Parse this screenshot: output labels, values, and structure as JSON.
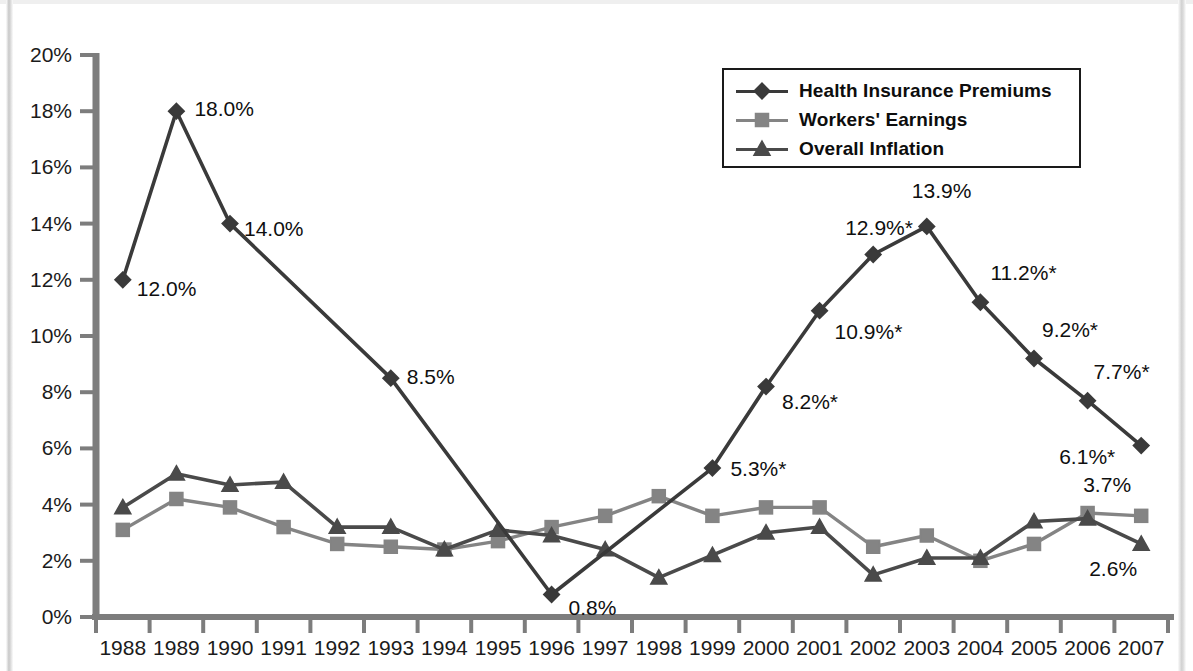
{
  "chart_data": {
    "type": "line",
    "title": "",
    "xlabel": "",
    "ylabel": "",
    "x": [
      1988,
      1989,
      1990,
      1991,
      1992,
      1993,
      1994,
      1995,
      1996,
      1997,
      1998,
      1999,
      2000,
      2001,
      2002,
      2003,
      2004,
      2005,
      2006,
      2007
    ],
    "categories": [
      "1988",
      "1989",
      "1990",
      "1991",
      "1992",
      "1993",
      "1994",
      "1995",
      "1996",
      "1997",
      "1998",
      "1999",
      "2000",
      "2001",
      "2002",
      "2003",
      "2004",
      "2005",
      "2006",
      "2007"
    ],
    "ylim": [
      0,
      20
    ],
    "ytick_values": [
      0,
      2,
      4,
      6,
      8,
      10,
      12,
      14,
      16,
      18,
      20
    ],
    "ytick_labels": [
      "0%",
      "2%",
      "4%",
      "6%",
      "8%",
      "10%",
      "12%",
      "14%",
      "16%",
      "18%",
      "20%"
    ],
    "grid": false,
    "legend_position": "top-right",
    "series": [
      {
        "name": "Health Insurance Premiums",
        "marker": "diamond",
        "color": "#3a3a3a",
        "values": [
          12.0,
          18.0,
          14.0,
          null,
          null,
          8.5,
          null,
          null,
          0.8,
          null,
          null,
          5.3,
          8.2,
          10.9,
          12.9,
          13.9,
          11.2,
          9.2,
          7.7,
          6.1
        ]
      },
      {
        "name": "Workers' Earnings",
        "marker": "square",
        "color": "#848484",
        "values": [
          3.1,
          4.2,
          3.9,
          3.2,
          2.6,
          2.5,
          2.4,
          2.7,
          3.2,
          3.6,
          4.3,
          3.6,
          3.9,
          3.9,
          2.5,
          2.9,
          2.0,
          2.6,
          3.7,
          3.6
        ]
      },
      {
        "name": "Overall Inflation",
        "marker": "triangle",
        "color": "#4a4a4a",
        "values": [
          3.9,
          5.1,
          4.7,
          4.8,
          3.2,
          3.2,
          2.4,
          3.1,
          2.9,
          2.4,
          1.4,
          2.2,
          3.0,
          3.2,
          1.5,
          2.1,
          2.1,
          3.4,
          3.5,
          2.6
        ]
      }
    ],
    "annotations": [
      {
        "series": "Health Insurance Premiums",
        "x": 1988,
        "text": "12.0%"
      },
      {
        "series": "Health Insurance Premiums",
        "x": 1989,
        "text": "18.0%"
      },
      {
        "series": "Health Insurance Premiums",
        "x": 1990,
        "text": "14.0%"
      },
      {
        "series": "Health Insurance Premiums",
        "x": 1993,
        "text": "8.5%"
      },
      {
        "series": "Health Insurance Premiums",
        "x": 1996,
        "text": "0.8%"
      },
      {
        "series": "Health Insurance Premiums",
        "x": 1999,
        "text": "5.3%*"
      },
      {
        "series": "Health Insurance Premiums",
        "x": 2000,
        "text": "8.2%*"
      },
      {
        "series": "Health Insurance Premiums",
        "x": 2001,
        "text": "10.9%*"
      },
      {
        "series": "Health Insurance Premiums",
        "x": 2002,
        "text": "12.9%*"
      },
      {
        "series": "Health Insurance Premiums",
        "x": 2003,
        "text": "13.9%"
      },
      {
        "series": "Health Insurance Premiums",
        "x": 2004,
        "text": "11.2%*"
      },
      {
        "series": "Health Insurance Premiums",
        "x": 2005,
        "text": "9.2%*"
      },
      {
        "series": "Health Insurance Premiums",
        "x": 2006,
        "text": "7.7%*"
      },
      {
        "series": "Health Insurance Premiums",
        "x": 2007,
        "text": "6.1%*"
      },
      {
        "series": "Workers' Earnings",
        "x": 2007,
        "text": "3.7%"
      },
      {
        "series": "Overall Inflation",
        "x": 2007,
        "text": "2.6%"
      }
    ]
  },
  "legend": {
    "items": [
      {
        "label": "Health Insurance Premiums",
        "marker": "diamond",
        "color": "#3a3a3a"
      },
      {
        "label": "Workers' Earnings",
        "marker": "square",
        "color": "#848484"
      },
      {
        "label": "Overall Inflation",
        "marker": "triangle",
        "color": "#4a4a4a"
      }
    ]
  },
  "axes": {
    "y_tick_labels": [
      "20%",
      "18%",
      "16%",
      "14%",
      "12%",
      "10%",
      "8%",
      "6%",
      "4%",
      "2%",
      "0%"
    ],
    "x_tick_labels": [
      "1988",
      "1989",
      "1990",
      "1991",
      "1992",
      "1993",
      "1994",
      "1995",
      "1996",
      "1997",
      "1998",
      "1999",
      "2000",
      "2001",
      "2002",
      "2003",
      "2004",
      "2005",
      "2006",
      "2007"
    ]
  },
  "title": {
    "text": ""
  }
}
